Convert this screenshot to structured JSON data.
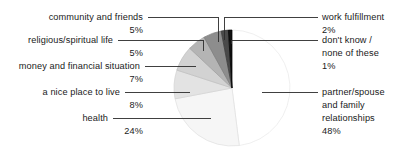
{
  "chart_data": {
    "type": "pie",
    "title": "",
    "subtitle": "",
    "xlabel": "",
    "ylabel": "",
    "legend_position": "callout-labels",
    "grid": false,
    "unit": "%",
    "total": 100,
    "categories": [
      "partner/spouse and family relationships",
      "health",
      "a nice place to live",
      "money and financial situation",
      "religious/spiritual life",
      "community and friends",
      "work fulfillment",
      "don't know / none of these"
    ],
    "values": [
      48,
      24,
      8,
      7,
      5,
      5,
      2,
      1
    ],
    "slices": [
      {
        "label_lines": [
          "partner/spouse",
          "and family",
          "relationships"
        ],
        "value": 48,
        "value_label": "48%",
        "color": "#ffffff",
        "stroke": "#e8e8e8"
      },
      {
        "label_lines": [
          "health"
        ],
        "value": 24,
        "value_label": "24%",
        "color": "#f6f6f6",
        "stroke": "#e0e0e0"
      },
      {
        "label_lines": [
          "a nice place to live"
        ],
        "value": 8,
        "value_label": "8%",
        "color": "#e3e3e3",
        "stroke": "#d2d2d2"
      },
      {
        "label_lines": [
          "money and financial situation"
        ],
        "value": 7,
        "value_label": "7%",
        "color": "#d2d2d2",
        "stroke": "#bdbdbd"
      },
      {
        "label_lines": [
          "religious/spiritual life"
        ],
        "value": 5,
        "value_label": "5%",
        "color": "#b4b4b4",
        "stroke": "#9e9e9e"
      },
      {
        "label_lines": [
          "community and friends"
        ],
        "value": 5,
        "value_label": "5%",
        "color": "#8d8d8d",
        "stroke": "#7a7a7a"
      },
      {
        "label_lines": [
          "work fulfillment"
        ],
        "value": 2,
        "value_label": "2%",
        "color": "#4a4a4a",
        "stroke": "#3a3a3a"
      },
      {
        "label_lines": [
          "don't know /",
          "none of these"
        ],
        "value": 1,
        "value_label": "1%",
        "color": "#111111",
        "stroke": "#000000"
      }
    ]
  },
  "labels": {
    "community_and_friends": "community and friends",
    "community_and_friends_pct": "5%",
    "religious_spiritual_life": "religious/spiritual life",
    "religious_spiritual_life_pct": "5%",
    "money_and_financial_situation": "money and financial situation",
    "money_and_financial_situation_pct": "7%",
    "a_nice_place_to_live": "a nice place to live",
    "a_nice_place_to_live_pct": "8%",
    "health": "health",
    "health_pct": "24%",
    "work_fulfillment": "work fulfillment",
    "work_fulfillment_pct": "2%",
    "dont_know_line1": "don't know /",
    "dont_know_line2": "none of these",
    "dont_know_pct": "1%",
    "partner_line1": "partner/spouse",
    "partner_line2": "and family",
    "partner_line3": "relationships",
    "partner_pct": "48%"
  },
  "style": {
    "leader_line_color": "#2b2b2b",
    "text_color": "#1a1a1a",
    "background": "#ffffff"
  }
}
